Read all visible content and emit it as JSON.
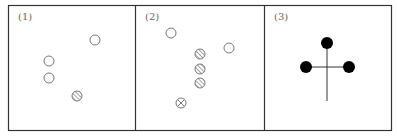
{
  "panels": [
    {
      "label": "(1)",
      "open_circles": [
        [
          95,
          40
        ],
        [
          49,
          61
        ],
        [
          49,
          78
        ]
      ],
      "hatched_circles": [
        [
          77,
          96
        ]
      ],
      "crossed_circles": []
    },
    {
      "label": "(2)",
      "open_circles": [
        [
          171,
          33
        ],
        [
          229,
          48
        ]
      ],
      "hatched_circles": [
        [
          200,
          54
        ],
        [
          200,
          69
        ],
        [
          200,
          83
        ]
      ],
      "crossed_circles": [
        [
          181,
          103
        ]
      ]
    },
    {
      "label": "(3)",
      "solid_dots": [
        [
          327,
          43
        ],
        [
          306,
          67
        ],
        [
          349,
          67
        ]
      ],
      "cross_center": [
        327,
        67
      ],
      "stem_end": [
        327,
        101
      ]
    }
  ],
  "colors": {
    "line": "#333333",
    "circle": "#777777",
    "solid": "#000000"
  }
}
